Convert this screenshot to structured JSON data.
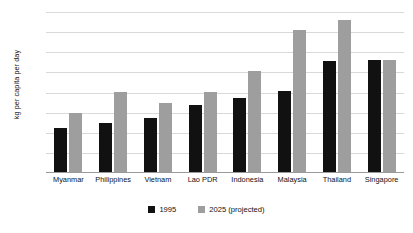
{
  "chart_data": {
    "type": "bar",
    "title": "",
    "xlabel": "",
    "ylabel": "kg per capita per day",
    "ylim": [
      0,
      1.6
    ],
    "ytick_step": 0.2,
    "yticks": [
      "1.60",
      "1.40",
      "1.20",
      "1.00",
      "0.80",
      "0.60",
      "0.40",
      "0.20",
      "0.00"
    ],
    "grid": true,
    "legend_position": "bottom-center",
    "categories": [
      "Myanmar",
      "Philippines",
      "Vietnam",
      "Lao PDR",
      "Indonesia",
      "Malaysia",
      "Thailand",
      "Singapore"
    ],
    "series": [
      {
        "name": "1995",
        "color": "#111111",
        "values": [
          0.45,
          0.5,
          0.55,
          0.68,
          0.75,
          0.82,
          1.11,
          1.12
        ]
      },
      {
        "name": "2025 (projected)",
        "color": "#9e9e9e",
        "values": [
          0.6,
          0.81,
          0.7,
          0.81,
          1.01,
          1.42,
          1.52,
          1.12
        ]
      }
    ]
  }
}
